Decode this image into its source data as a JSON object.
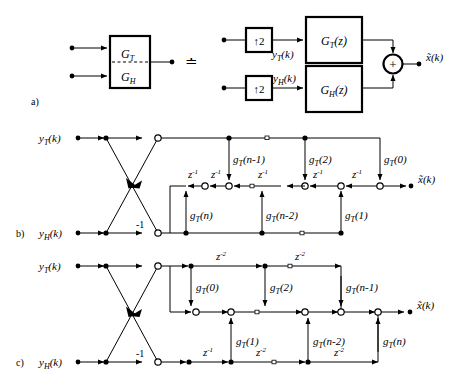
{
  "figure": {
    "type": "signal-flow-diagram",
    "panels": [
      {
        "id": "a",
        "label": "a)"
      },
      {
        "id": "b",
        "label": "b)"
      },
      {
        "id": "c",
        "label": "c)"
      }
    ]
  },
  "panel_a": {
    "label": "a)",
    "combined_block": {
      "top_label": "G",
      "top_sub": "T",
      "bottom_label": "G",
      "bottom_sub": "H",
      "divider": "dashed"
    },
    "equivalence_symbol": "≐",
    "upsampler_top": "↑2",
    "upsampler_bottom": "↑2",
    "signal_top": "y",
    "signal_top_sub": "T",
    "signal_top_arg": "(k)",
    "signal_bottom": "y",
    "signal_bottom_sub": "H",
    "signal_bottom_arg": "(k)",
    "filter_top": "G",
    "filter_top_sub": "T",
    "filter_top_arg": "(z)",
    "filter_bottom": "G",
    "filter_bottom_sub": "H",
    "filter_bottom_arg": "(z)",
    "adder": "+",
    "output": "x̃(k)"
  },
  "panel_b": {
    "label": "b)",
    "input_top": {
      "base": "y",
      "sub": "T",
      "arg": "(k)"
    },
    "input_bottom": {
      "base": "y",
      "sub": "H",
      "arg": "(k)"
    },
    "crossover_gain": "-1",
    "output": {
      "base": "x̃",
      "arg": "(k)"
    },
    "delay_label": "z",
    "delay_exp": "-1",
    "delays": [
      "z-1",
      "z-1",
      "z-1",
      "z-1",
      "z-1"
    ],
    "coeffs_upper": [
      {
        "base": "g",
        "sub": "T",
        "arg": "(n-1)"
      },
      {
        "base": "g",
        "sub": "T",
        "arg": "(2)"
      },
      {
        "base": "g",
        "sub": "T",
        "arg": "(0)"
      }
    ],
    "coeffs_lower": [
      {
        "base": "g",
        "sub": "T",
        "arg": "(n)"
      },
      {
        "base": "g",
        "sub": "T",
        "arg": "(n-2)"
      },
      {
        "base": "g",
        "sub": "T",
        "arg": "(1)"
      }
    ]
  },
  "panel_c": {
    "label": "c)",
    "input_top": {
      "base": "y",
      "sub": "T",
      "arg": "(k)"
    },
    "input_bottom": {
      "base": "y",
      "sub": "H",
      "arg": "(k)"
    },
    "crossover_gain": "-1",
    "output": {
      "base": "x̃",
      "arg": "(k)"
    },
    "delays_top": [
      "z-2",
      "z-2"
    ],
    "delays_bottom": [
      "z-1",
      "z-2",
      "z-2"
    ],
    "coeffs_upper": [
      {
        "base": "g",
        "sub": "T",
        "arg": "(0)"
      },
      {
        "base": "g",
        "sub": "T",
        "arg": "(2)"
      },
      {
        "base": "g",
        "sub": "T",
        "arg": "(n-1)"
      }
    ],
    "coeffs_lower": [
      {
        "base": "g",
        "sub": "T",
        "arg": "(1)"
      },
      {
        "base": "g",
        "sub": "T",
        "arg": "(n-2)"
      },
      {
        "base": "g",
        "sub": "T",
        "arg": "(n)"
      }
    ]
  }
}
